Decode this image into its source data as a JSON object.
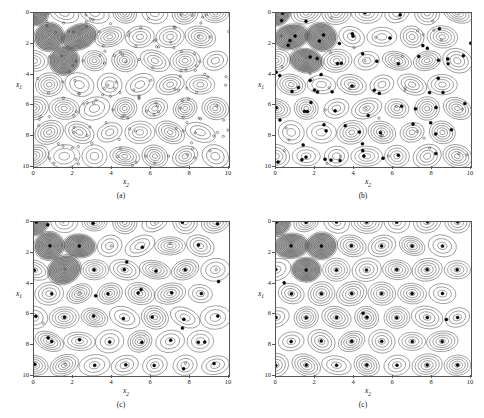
{
  "figure": {
    "background": "#ffffff",
    "panel_count": 4,
    "marker_open_color": "#333333",
    "marker_filled_color": "#000000",
    "contour_color": "#3a3a3a",
    "axis_color": "#555555"
  },
  "axes": {
    "xlabel": "x",
    "xlabel_sub": "2",
    "ylabel": "x",
    "ylabel_sub": "1",
    "xticks": [
      "0",
      "2",
      "4",
      "6",
      "8",
      "10"
    ],
    "yticks": [
      "0",
      "2",
      "4",
      "6",
      "8",
      "10"
    ],
    "xlim": [
      0,
      10
    ],
    "ylim": [
      0,
      10
    ],
    "y_inverted": true
  },
  "chart_data": {
    "type": "scatter",
    "title": "",
    "xlabel": "x2",
    "ylabel": "x1",
    "xlim": [
      0,
      10
    ],
    "ylim": [
      0,
      10
    ],
    "y_inverted": true,
    "grid": false,
    "legend": null,
    "peak_lattice": {
      "row_spacing_x1": 1.55,
      "col_spacing_x2": 1.55,
      "row_stagger_x2": 0.775,
      "peaks": [
        [
          0.0,
          0.0
        ],
        [
          1.55,
          0.0
        ],
        [
          3.1,
          0.0
        ],
        [
          4.65,
          0.0
        ],
        [
          6.2,
          0.0
        ],
        [
          7.75,
          0.0
        ],
        [
          9.3,
          0.0
        ],
        [
          0.78,
          1.55
        ],
        [
          2.33,
          1.55
        ],
        [
          3.88,
          1.55
        ],
        [
          5.43,
          1.55
        ],
        [
          6.98,
          1.55
        ],
        [
          8.53,
          1.55
        ],
        [
          0.0,
          3.1
        ],
        [
          1.55,
          3.1
        ],
        [
          3.1,
          3.1
        ],
        [
          4.65,
          3.1
        ],
        [
          6.2,
          3.1
        ],
        [
          7.75,
          3.1
        ],
        [
          9.3,
          3.1
        ],
        [
          0.78,
          4.65
        ],
        [
          2.33,
          4.65
        ],
        [
          3.88,
          4.65
        ],
        [
          5.43,
          4.65
        ],
        [
          6.98,
          4.65
        ],
        [
          8.53,
          4.65
        ],
        [
          0.0,
          6.2
        ],
        [
          1.55,
          6.2
        ],
        [
          3.1,
          6.2
        ],
        [
          4.65,
          6.2
        ],
        [
          6.2,
          6.2
        ],
        [
          7.75,
          6.2
        ],
        [
          9.3,
          6.2
        ],
        [
          0.78,
          7.75
        ],
        [
          2.33,
          7.75
        ],
        [
          3.88,
          7.75
        ],
        [
          5.43,
          7.75
        ],
        [
          6.98,
          7.75
        ],
        [
          8.53,
          7.75
        ],
        [
          0.0,
          9.3
        ],
        [
          1.55,
          9.3
        ],
        [
          3.1,
          9.3
        ],
        [
          4.65,
          9.3
        ],
        [
          6.2,
          9.3
        ],
        [
          7.75,
          9.3
        ],
        [
          9.3,
          9.3
        ]
      ],
      "shaded_peaks": [
        [
          0.78,
          1.55
        ],
        [
          1.55,
          3.1
        ],
        [
          2.33,
          1.55
        ],
        [
          0.0,
          0.0
        ]
      ]
    },
    "series": [
      {
        "name": "(a) initial population",
        "panel": "a",
        "marker": "open-circle",
        "point_count": 120,
        "state": "uniformly scattered across the domain"
      },
      {
        "name": "(b) intermediate iteration",
        "panel": "b",
        "marker": "mixed-filled-and-open",
        "point_count": 120,
        "state": "partially clustered toward peak centers"
      },
      {
        "name": "(c) later iteration",
        "panel": "c",
        "marker": "filled-circle",
        "point_count": 60,
        "state": "nearly all points located at peak centers"
      },
      {
        "name": "(c) converged",
        "panel": "d",
        "marker": "filled-circle",
        "point_count": 46,
        "state": "exactly one point at every peak center"
      }
    ]
  },
  "panels": [
    {
      "id": "a",
      "caption": "(a)",
      "marker_style": "open",
      "seed": 11,
      "spread": 2.6,
      "extra_random": 78,
      "filled_ratio": 0.0
    },
    {
      "id": "b",
      "caption": "(b)",
      "marker_style": "mixed",
      "seed": 27,
      "spread": 0.62,
      "extra_random": 34,
      "filled_ratio": 0.62
    },
    {
      "id": "c",
      "caption": "(c)",
      "marker_style": "filled",
      "seed": 43,
      "spread": 0.16,
      "extra_random": 10,
      "filled_ratio": 0.9
    },
    {
      "id": "d",
      "caption": "(c)",
      "marker_style": "filled",
      "seed": 59,
      "spread": 0.02,
      "extra_random": 3,
      "filled_ratio": 1.0
    }
  ]
}
